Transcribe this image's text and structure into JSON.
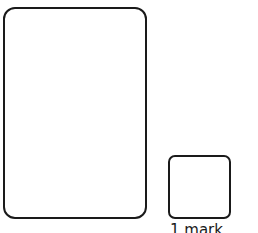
{
  "large_answer_box": {
    "label": ""
  },
  "small_answer_box": {
    "label": ""
  },
  "marks_label": "1 mark"
}
